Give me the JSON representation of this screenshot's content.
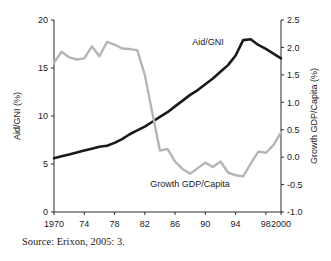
{
  "source_note": "Source: Erixon, 2005: 3.",
  "chart_data": {
    "type": "line",
    "title": "",
    "xlabel": "",
    "grid": false,
    "legend_position": "inline-annotation",
    "x": [
      1970,
      1971,
      1972,
      1973,
      1974,
      1975,
      1976,
      1977,
      1978,
      1979,
      1980,
      1981,
      1982,
      1983,
      1984,
      1985,
      1986,
      1987,
      1988,
      1989,
      1990,
      1991,
      1992,
      1993,
      1994,
      1995,
      1996,
      1997,
      1998,
      1999,
      2000
    ],
    "xticks": [
      1970,
      1974,
      1978,
      1982,
      1986,
      1990,
      1994,
      1998,
      2000
    ],
    "xticklabels": [
      "1970",
      "74",
      "78",
      "82",
      "86",
      "90",
      "94",
      "98",
      "2000"
    ],
    "xlim": [
      1970,
      2000
    ],
    "axes": [
      {
        "id": "left",
        "label": "Aid/GNI (%)",
        "lim": [
          0,
          20
        ],
        "ticks": [
          0,
          5,
          10,
          15,
          20
        ],
        "ticklabels": [
          "0",
          "5",
          "10",
          "15",
          "20"
        ]
      },
      {
        "id": "right",
        "label": "Growth GDP/Capita (%)",
        "lim": [
          -1.0,
          2.5
        ],
        "ticks": [
          -1.0,
          -0.5,
          0.0,
          0.5,
          1.0,
          1.5,
          2.0,
          2.5
        ],
        "ticklabels": [
          "-1.0",
          "-0.5",
          "0.0",
          "0.5",
          "1.0",
          "1.5",
          "2.0",
          "2.5"
        ]
      }
    ],
    "series": [
      {
        "name": "Aid/GNI",
        "axis": "left",
        "color": "#1a1a1a",
        "width": 2.6,
        "label_text": "Aid/GNI",
        "values": [
          5.6,
          5.8,
          6.0,
          6.2,
          6.4,
          6.6,
          6.8,
          6.9,
          7.2,
          7.6,
          8.1,
          8.5,
          8.9,
          9.4,
          9.9,
          10.4,
          11.0,
          11.6,
          12.2,
          12.7,
          13.3,
          13.9,
          14.6,
          15.3,
          16.3,
          17.9,
          18.0,
          17.4,
          17.0,
          16.5,
          16.0
        ]
      },
      {
        "name": "Growth GDP/Capita",
        "axis": "right",
        "color": "#b5b5b5",
        "width": 2.4,
        "label_text": "Growth GDP/Capita",
        "values": [
          1.72,
          1.92,
          1.82,
          1.78,
          1.8,
          2.02,
          1.84,
          2.1,
          2.05,
          1.98,
          1.97,
          1.95,
          1.5,
          0.8,
          0.12,
          0.15,
          -0.08,
          -0.22,
          -0.3,
          -0.2,
          -0.1,
          -0.18,
          -0.08,
          -0.28,
          -0.33,
          -0.35,
          -0.12,
          0.1,
          0.08,
          0.22,
          0.45
        ]
      }
    ]
  }
}
